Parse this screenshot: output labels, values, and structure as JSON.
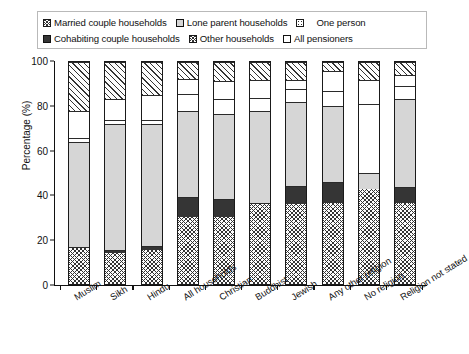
{
  "chart_data": {
    "type": "bar",
    "subtype": "stacked-bar-100-percent",
    "title": "",
    "xlabel": "",
    "ylabel": "Percentage (%)",
    "ylim": [
      0,
      100
    ],
    "yticks": [
      0,
      20,
      40,
      60,
      80,
      100
    ],
    "grid": false,
    "legend_position": "top",
    "categories": [
      "Muslim",
      "Sikh",
      "Hindu",
      "All households",
      "Christian",
      "Buddhist",
      "Jewish",
      "Any other religion",
      "No religion",
      "Religion not stated"
    ],
    "series": [
      {
        "name": "Married couple households",
        "pattern": "cross",
        "values": [
          16,
          14,
          15.5,
          30,
          30,
          36,
          36,
          36.5,
          43,
          36.5
        ]
      },
      {
        "name": "Cohabiting couple households",
        "pattern": "solid",
        "values": [
          0.5,
          1.5,
          1.5,
          9,
          8.5,
          0.5,
          8,
          9.5,
          0,
          7
        ]
      },
      {
        "name": "Lone parent households",
        "pattern": "grey",
        "values": [
          47.5,
          56.5,
          55,
          39,
          38,
          41.5,
          38,
          34,
          7,
          40
        ]
      },
      {
        "name": "One person",
        "pattern": "dot",
        "values": [
          2,
          2,
          2,
          7.5,
          7,
          6,
          6,
          7,
          31,
          5.5
        ]
      },
      {
        "name": "Other households",
        "pattern": "white",
        "values": [
          12,
          9.5,
          11,
          7,
          8,
          8,
          4,
          9,
          11,
          5
        ]
      },
      {
        "name": "All pensioners",
        "pattern": "diag",
        "values": [
          22,
          16.5,
          15,
          7.5,
          8.5,
          8,
          8,
          4,
          8,
          6
        ]
      }
    ],
    "stack_order_bottom_to_top": [
      "Married couple households",
      "Cohabiting couple households",
      "Lone parent households",
      "One person",
      "Other households",
      "All pensioners"
    ]
  },
  "legend": {
    "row1": [
      {
        "label": "Married couple households",
        "pattern": "cross"
      },
      {
        "label": "Lone parent households",
        "pattern": "grey"
      },
      {
        "label": "One person",
        "pattern": "dot"
      }
    ],
    "row2": [
      {
        "label": "Cohabiting couple households",
        "pattern": "solid"
      },
      {
        "label": "Other households",
        "pattern": "white"
      },
      {
        "label": "All pensioners",
        "pattern": "diag"
      }
    ]
  },
  "axis": {
    "y_label": "Percentage (%)",
    "y_ticks": [
      "0",
      "20",
      "40",
      "60",
      "80",
      "100"
    ]
  },
  "colors": {
    "ink": "#111111",
    "solid_fill": "#353535",
    "grey_fill": "#d6d6d6",
    "background": "#ffffff",
    "legend_border": "#b9b9b9"
  }
}
